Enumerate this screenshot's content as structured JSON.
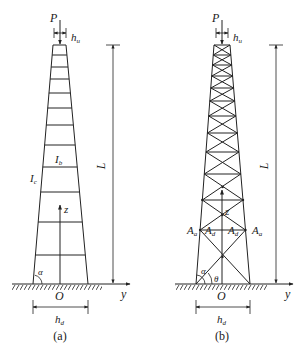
{
  "figure": {
    "panels": [
      {
        "id": "a",
        "caption": "(a)",
        "type": "tapered-frame-tower",
        "labels": {
          "load": "P",
          "top_width": "h",
          "top_width_sub": "u",
          "column": "I",
          "column_sub": "c",
          "beam": "I",
          "beam_sub": "b",
          "height": "L",
          "axis_z": "z",
          "axis_y": "y",
          "origin": "O",
          "angle": "α",
          "base_width": "h",
          "base_width_sub": "d"
        }
      },
      {
        "id": "b",
        "caption": "(b)",
        "type": "tapered-truss-tower",
        "labels": {
          "load": "P",
          "top_width": "h",
          "top_width_sub": "u",
          "height": "L",
          "axis_z": "z",
          "axis_y": "y",
          "origin": "O",
          "angle_alpha": "α",
          "angle_theta": "θ",
          "chord_left": "A",
          "chord_left_sub": "a",
          "diag_left": "A",
          "diag_left_sub": "d",
          "diag_right": "A",
          "diag_right_sub": "d",
          "chord_right": "A",
          "chord_right_sub": "a",
          "base_width": "h",
          "base_width_sub": "d"
        }
      }
    ]
  }
}
